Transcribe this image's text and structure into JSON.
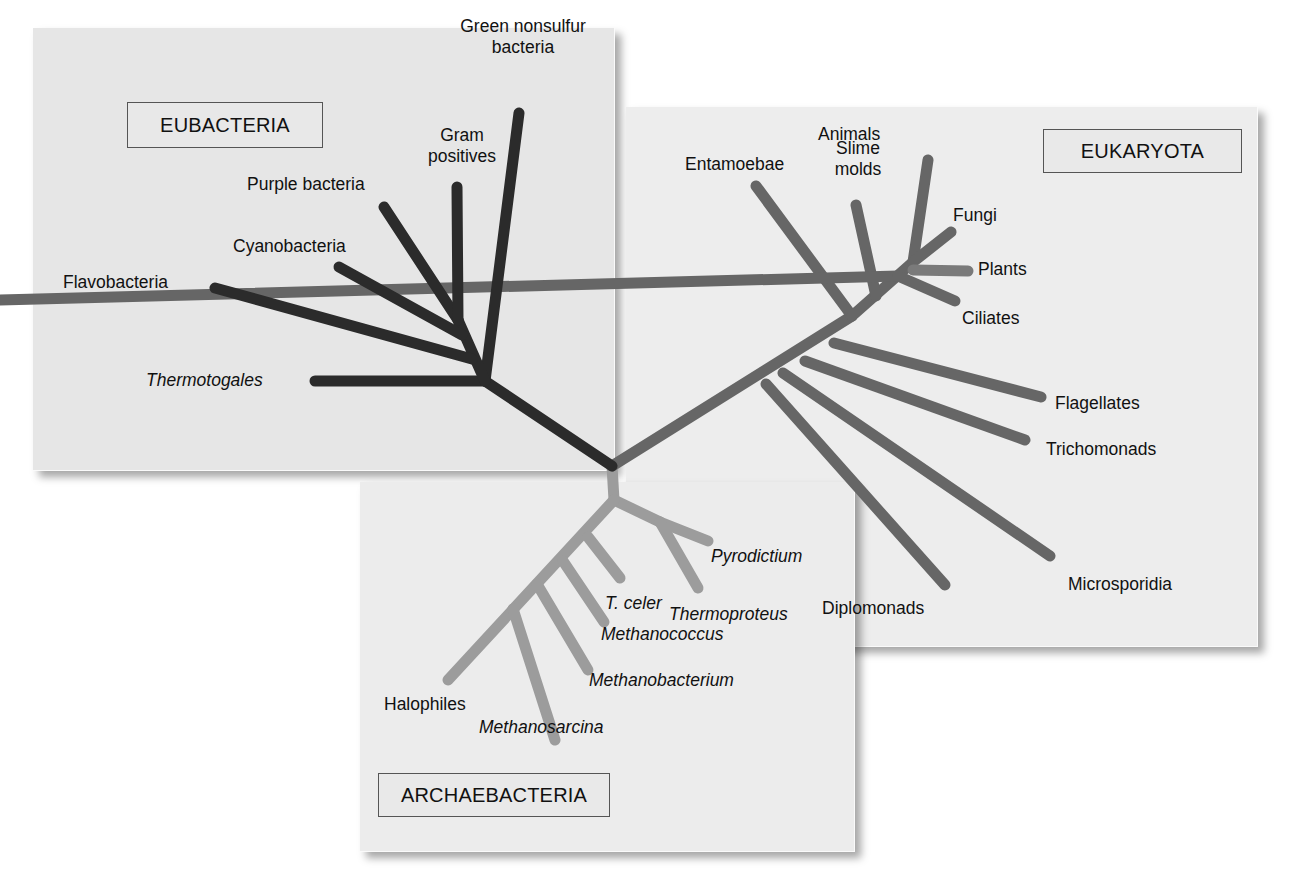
{
  "diagram": {
    "type": "unrooted phylogenetic tree",
    "colors": {
      "eubacteria_branch": "#2b2b2b",
      "eukaryota_branch": "#666666",
      "eukaryota_plants_branch": "#7a7a7a",
      "archaea_branch": "#9c9c9c",
      "panel_background": "#ebebeb",
      "box_border": "#555555"
    },
    "groups": {
      "eubacteria": {
        "title": "EUBACTERIA",
        "taxa": {
          "green_nonsulfur_line1": "Green nonsulfur",
          "green_nonsulfur_line2": "bacteria",
          "gram_positives_line1": "Gram",
          "gram_positives_line2": "positives",
          "purple_bacteria": "Purple bacteria",
          "cyanobacteria": "Cyanobacteria",
          "flavobacteria": "Flavobacteria",
          "thermotogales": "Thermotogales"
        }
      },
      "eukaryota": {
        "title": "EUKARYOTA",
        "taxa": {
          "entamoebae": "Entamoebae",
          "slime_molds_line1": "Slime",
          "slime_molds_line2": "molds",
          "animals": "Animals",
          "fungi": "Fungi",
          "plants": "Plants",
          "ciliates": "Ciliates",
          "flagellates": "Flagellates",
          "trichomonads": "Trichomonads",
          "microsporidia": "Microsporidia",
          "diplomonads": "Diplomonads"
        }
      },
      "archaebacteria": {
        "title": "ARCHAEBACTERIA",
        "taxa": {
          "pyrodictium": "Pyrodictium",
          "thermoproteus": "Thermoproteus",
          "t_celer": "T. celer",
          "methanococcus": "Methanococcus",
          "methanobacterium": "Methanobacterium",
          "methanosarcina": "Methanosarcina",
          "halophiles": "Halophiles"
        }
      }
    }
  }
}
